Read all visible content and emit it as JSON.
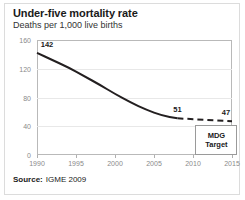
{
  "header": {
    "title": "Under-five mortality rate",
    "subtitle": "Deaths per 1,000 live births"
  },
  "footer": {
    "source_label": "Source:",
    "source_value": "IGME 2009"
  },
  "annotations": {
    "mdg_line1": "MDG",
    "mdg_line2": "Target"
  },
  "colors": {
    "line": "#231f20",
    "grid": "#e8e8e8",
    "axis": "#b9b9b9",
    "tick_text": "#8a8a8a",
    "frame": "#dcdcdc"
  },
  "chart_data": {
    "type": "line",
    "title": "Under-five mortality rate",
    "subtitle": "Deaths per 1,000 live births",
    "xlabel": "",
    "ylabel": "Deaths per 1,000 live births",
    "xlim": [
      1990,
      2015
    ],
    "ylim": [
      0,
      160
    ],
    "xticks": [
      1990,
      1995,
      2000,
      2005,
      2010,
      2015
    ],
    "yticks": [
      0,
      40,
      80,
      120,
      160
    ],
    "xtick_labels": [
      "1990",
      "1995",
      "2000",
      "2005",
      "2010",
      "2015"
    ],
    "ytick_labels": [
      "0",
      "40",
      "80",
      "120",
      "160"
    ],
    "grid": true,
    "legend": false,
    "series": [
      {
        "name": "Observed under-five mortality rate",
        "style": "solid",
        "x": [
          1990,
          1992,
          1994,
          1996,
          1998,
          2000,
          2002,
          2004,
          2006,
          2008
        ],
        "values": [
          142,
          132,
          122,
          110,
          98,
          85,
          73,
          63,
          55,
          51
        ]
      },
      {
        "name": "Projection to MDG target",
        "style": "dashed",
        "x": [
          2008,
          2015
        ],
        "values": [
          51,
          47
        ]
      }
    ],
    "point_labels": [
      {
        "text": "142",
        "x": 1990,
        "y": 142
      },
      {
        "text": "51",
        "x": 2008,
        "y": 51
      },
      {
        "text": "47",
        "x": 2015,
        "y": 47
      }
    ],
    "annotations": [
      {
        "text": "MDG Target",
        "x": 2013,
        "y": 22
      }
    ]
  }
}
